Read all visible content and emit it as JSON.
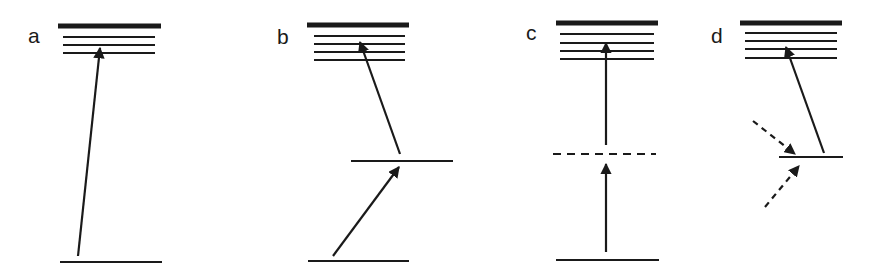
{
  "figure": {
    "type": "energy-level-diagram",
    "panels": [
      {
        "label": "a",
        "description": "Direct one-photon excitation from ground level to excited manifold",
        "levels": [
          {
            "name": "excited-top",
            "y": 26,
            "x1": 58,
            "x2": 161,
            "thick": true
          },
          {
            "name": "excited-sublevel-1",
            "y": 37,
            "x1": 63,
            "x2": 155
          },
          {
            "name": "excited-sublevel-2",
            "y": 45,
            "x1": 63,
            "x2": 155
          },
          {
            "name": "excited-sublevel-3",
            "y": 53,
            "x1": 63,
            "x2": 155
          },
          {
            "name": "ground",
            "y": 262,
            "x1": 60,
            "x2": 162
          }
        ],
        "arrows": [
          {
            "style": "solid",
            "x1": 78,
            "y1": 256,
            "x2": 100,
            "y2": 48
          }
        ]
      },
      {
        "label": "b",
        "description": "Stepwise excitation via a real intermediate level",
        "levels": [
          {
            "name": "excited-top",
            "y": 25,
            "x1": 307,
            "x2": 409,
            "thick": true
          },
          {
            "name": "excited-sublevel-1",
            "y": 36,
            "x1": 314,
            "x2": 405
          },
          {
            "name": "excited-sublevel-2",
            "y": 44,
            "x1": 314,
            "x2": 405
          },
          {
            "name": "excited-sublevel-3",
            "y": 52,
            "x1": 314,
            "x2": 405
          },
          {
            "name": "excited-sublevel-4",
            "y": 60,
            "x1": 314,
            "x2": 405
          },
          {
            "name": "intermediate",
            "y": 161,
            "x1": 351,
            "x2": 453
          },
          {
            "name": "ground",
            "y": 261,
            "x1": 308,
            "x2": 409
          }
        ],
        "arrows": [
          {
            "style": "solid",
            "x1": 333,
            "y1": 256,
            "x2": 399,
            "y2": 167
          },
          {
            "style": "solid",
            "x1": 400,
            "y1": 154,
            "x2": 360,
            "y2": 42
          }
        ]
      },
      {
        "label": "c",
        "description": "Two-photon excitation via a virtual (dashed) level",
        "levels": [
          {
            "name": "excited-top",
            "y": 23,
            "x1": 556,
            "x2": 658,
            "thick": true
          },
          {
            "name": "excited-sublevel-1",
            "y": 34,
            "x1": 560,
            "x2": 654
          },
          {
            "name": "excited-sublevel-2",
            "y": 43,
            "x1": 560,
            "x2": 654
          },
          {
            "name": "excited-sublevel-3",
            "y": 51,
            "x1": 560,
            "x2": 654
          },
          {
            "name": "excited-sublevel-4",
            "y": 59,
            "x1": 560,
            "x2": 654
          },
          {
            "name": "virtual",
            "y": 154,
            "x1": 553,
            "x2": 656,
            "dashed": true
          },
          {
            "name": "ground",
            "y": 260,
            "x1": 556,
            "x2": 659
          }
        ],
        "arrows": [
          {
            "style": "solid",
            "x1": 606,
            "y1": 252,
            "x2": 606,
            "y2": 164
          },
          {
            "style": "solid",
            "x1": 606,
            "y1": 145,
            "x2": 606,
            "y2": 43
          }
        ]
      },
      {
        "label": "d",
        "description": "Excitation from a level populated by dashed (non-radiative/other) processes",
        "levels": [
          {
            "name": "excited-top",
            "y": 23,
            "x1": 740,
            "x2": 842,
            "thick": true
          },
          {
            "name": "excited-sublevel-1",
            "y": 33,
            "x1": 745,
            "x2": 837
          },
          {
            "name": "excited-sublevel-2",
            "y": 41,
            "x1": 745,
            "x2": 837
          },
          {
            "name": "excited-sublevel-3",
            "y": 49,
            "x1": 745,
            "x2": 837
          },
          {
            "name": "excited-sublevel-4",
            "y": 58,
            "x1": 745,
            "x2": 837
          },
          {
            "name": "lower",
            "y": 157,
            "x1": 779,
            "x2": 843
          }
        ],
        "arrows": [
          {
            "style": "dashed",
            "x1": 753,
            "y1": 121,
            "x2": 795,
            "y2": 154
          },
          {
            "style": "dashed",
            "x1": 765,
            "y1": 207,
            "x2": 799,
            "y2": 166
          },
          {
            "style": "solid",
            "x1": 824,
            "y1": 153,
            "x2": 786,
            "y2": 47
          }
        ]
      }
    ]
  },
  "labels": {
    "a": {
      "text": "a",
      "x": 28,
      "y": 43
    },
    "b": {
      "text": "b",
      "x": 277,
      "y": 44
    },
    "c": {
      "text": "c",
      "x": 526,
      "y": 40
    },
    "d": {
      "text": "d",
      "x": 711,
      "y": 43
    }
  },
  "colors": {
    "ink": "#1a1a1a",
    "background": "#ffffff"
  }
}
